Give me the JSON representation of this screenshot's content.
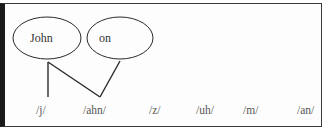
{
  "diagram": {
    "words": [
      {
        "label": "John",
        "cx": 47,
        "cy": 38,
        "rx": 34,
        "ry": 21
      },
      {
        "label": "on",
        "cx": 120,
        "cy": 38,
        "rx": 33,
        "ry": 21
      }
    ],
    "phonemes": [
      {
        "label": "/j/",
        "x": 35
      },
      {
        "label": "/ahn/",
        "x": 83
      },
      {
        "label": "/z/",
        "x": 148
      },
      {
        "label": "/uh/",
        "x": 196
      },
      {
        "label": "/m/",
        "x": 242
      },
      {
        "label": "/an/",
        "x": 296
      }
    ],
    "connections": [
      {
        "from": "John",
        "to": "/j/"
      },
      {
        "from": "John",
        "to": "/ahn/"
      },
      {
        "from": "on",
        "to": "/ahn/"
      }
    ],
    "colors": {
      "line": "#2a2a2a",
      "ellipse_stroke": "#2a2a2a",
      "left_bar": "#1a1a1a",
      "text": "#444444"
    }
  }
}
